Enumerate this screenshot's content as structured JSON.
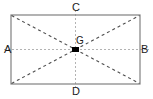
{
  "figure": {
    "type": "geometry-diagram",
    "labels": {
      "left": "A",
      "right": "B",
      "top": "C",
      "bottom": "D",
      "centroid": "G"
    },
    "colors": {
      "background": "#ffffff",
      "rectangle_stroke": "#808080",
      "diagonal_stroke": "#4d4d4d",
      "axis_stroke": "#b3b3b3",
      "centroid_fill": "#000000",
      "label_text": "#1a1a1a"
    },
    "geometry": {
      "rect_left": 11,
      "rect_top": 15,
      "rect_right": 140,
      "rect_bottom": 84,
      "center_x": 75.5,
      "center_y": 49.5,
      "centroid_marker_width": 7,
      "centroid_marker_height": 5
    },
    "strokes": {
      "rectangle_width": 1.2,
      "diagonal_width": 1.1,
      "diagonal_dash": "3 3",
      "axis_width": 1,
      "axis_dash": "2 2"
    }
  }
}
